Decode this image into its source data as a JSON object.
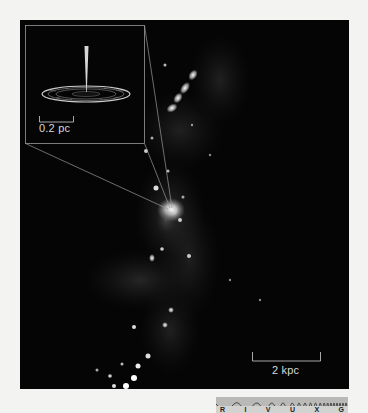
{
  "figure": {
    "inset": {
      "scale_label": "0.2 pc"
    },
    "main": {
      "scale_label": "2 kpc"
    },
    "spectrum_strip": {
      "bands": [
        "R",
        "I",
        "V",
        "U",
        "X",
        "G"
      ],
      "highlighted_band": "R"
    },
    "colors": {
      "background": "#f3f3f1",
      "photo": "#050505",
      "label_text": "#d8d8d8",
      "strip_wave": "#b9b9b7",
      "strip_bands": "#d2d2d0"
    }
  }
}
